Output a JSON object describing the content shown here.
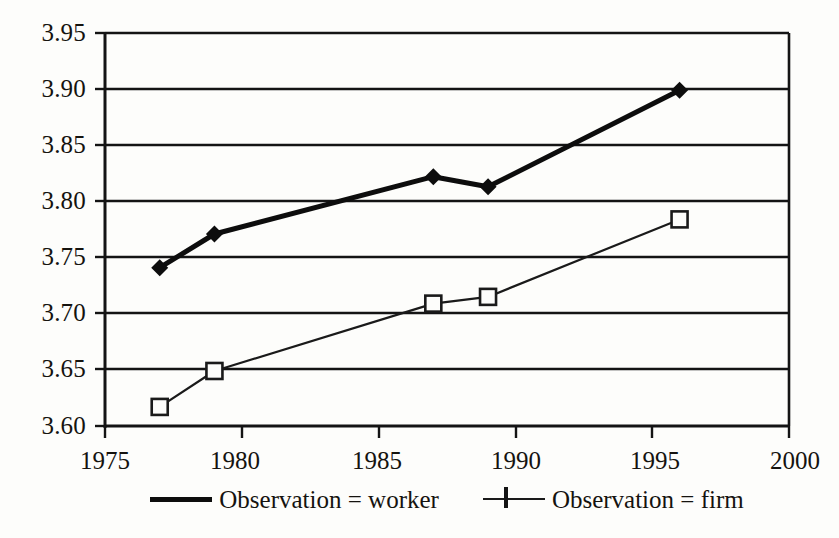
{
  "chart_data": {
    "type": "line",
    "title": "",
    "subtitle": "",
    "xlabel": "",
    "ylabel": "",
    "xlim": [
      1975,
      2000
    ],
    "ylim": [
      3.6,
      3.95
    ],
    "grid": "horizontal",
    "legend_position": "bottom",
    "x_ticks": [
      "1975",
      "1980",
      "1985",
      "1990",
      "1995",
      "2000"
    ],
    "y_ticks": [
      "3.95",
      "3.90",
      "3.85",
      "3.80",
      "3.75",
      "3.70",
      "3.65",
      "3.60"
    ],
    "series": [
      {
        "name": "Observation = worker",
        "marker": "filled-diamond",
        "line_style": "thick-solid",
        "color": "#0d0d0d",
        "x": [
          1977,
          1979,
          1987,
          1989,
          1996
        ],
        "values": [
          3.741,
          3.771,
          3.822,
          3.813,
          3.899
        ]
      },
      {
        "name": "Observation = firm",
        "marker": "open-square",
        "line_style": "thin-solid",
        "color": "#1a1a1a",
        "x": [
          1977,
          1979,
          1987,
          1989,
          1996
        ],
        "values": [
          3.617,
          3.649,
          3.709,
          3.715,
          3.784
        ]
      }
    ]
  },
  "legend": {
    "entries": [
      {
        "label": "Observation = worker"
      },
      {
        "label": "Observation = firm"
      }
    ]
  },
  "axes": {
    "y_labels": [
      "3.95",
      "3.90",
      "3.85",
      "3.80",
      "3.75",
      "3.70",
      "3.65",
      "3.60"
    ],
    "x_labels": [
      "1975",
      "1980",
      "1985",
      "1990",
      "1995",
      "2000"
    ]
  }
}
